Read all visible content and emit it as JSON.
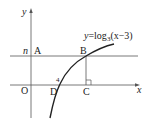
{
  "diagram": {
    "equation": {
      "lhs": "y",
      "eq": "=log",
      "base": "3",
      "arg": "(x−3)"
    },
    "axes": {
      "x_label": "x",
      "y_label": "y",
      "origin_label": "O"
    },
    "points": {
      "A": "A",
      "B": "B",
      "C": "C",
      "D": "D"
    },
    "level_label": "n",
    "tick_label": "4",
    "colors": {
      "stroke": "#333333",
      "text": "#222222",
      "background": "#ffffff"
    }
  }
}
